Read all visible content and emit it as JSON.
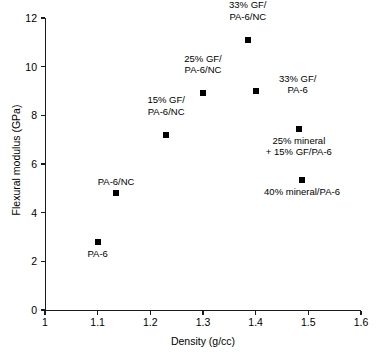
{
  "chart_data": {
    "type": "scatter",
    "title": "",
    "xlabel": "Density (g/cc)",
    "ylabel": "Flexural modulus (GPa)",
    "xlim": [
      1,
      1.6
    ],
    "ylim": [
      0,
      12
    ],
    "xticks": [
      "1",
      "1.1",
      "1.2",
      "1.3",
      "1.4",
      "1.5",
      "1.6"
    ],
    "xtick_values": [
      1,
      1.1,
      1.2,
      1.3,
      1.4,
      1.5,
      1.6
    ],
    "yticks": [
      "0",
      "2",
      "4",
      "6",
      "8",
      "10",
      "12"
    ],
    "ytick_values": [
      0,
      2,
      4,
      6,
      8,
      10,
      12
    ],
    "grid": false,
    "legend": "none",
    "marker_color": "#000000",
    "marker_shape": "square",
    "points": [
      {
        "label": "PA-6",
        "label_lines": [
          "PA-6"
        ],
        "x": 1.1,
        "y": 2.8,
        "label_dx": 0,
        "label_dy": 6
      },
      {
        "label": "PA-6/NC",
        "label_lines": [
          "PA-6/NC"
        ],
        "x": 1.135,
        "y": 4.8,
        "label_dx": 0,
        "label_dy": -17
      },
      {
        "label": "15% GF/PA-6/NC",
        "label_lines": [
          "15% GF/",
          "PA-6/NC"
        ],
        "x": 1.23,
        "y": 7.2,
        "label_dx": 0,
        "label_dy": -29
      },
      {
        "label": "25% GF/PA-6/NC",
        "label_lines": [
          "25% GF/",
          "PA-6/NC"
        ],
        "x": 1.3,
        "y": 8.9,
        "label_dx": 0,
        "label_dy": -29
      },
      {
        "label": "33% GF/PA-6/NC",
        "label_lines": [
          "33% GF/",
          "PA-6/NC"
        ],
        "x": 1.385,
        "y": 11.1,
        "label_dx": 0,
        "label_dy": -29
      },
      {
        "label": "33% GF/PA-6",
        "label_lines": [
          "33% GF/",
          "PA-6"
        ],
        "x": 1.4,
        "y": 9.0,
        "label_dx": 42,
        "label_dy": -7
      },
      {
        "label": "25% mineral + 15% GF/PA-6",
        "label_lines": [
          "25% mineral",
          "+ 15% GF/PA-6"
        ],
        "x": 1.482,
        "y": 7.45,
        "label_dx": 0,
        "label_dy": 6
      },
      {
        "label": "40% mineral/PA-6",
        "label_lines": [
          "40% mineral/PA-6"
        ],
        "x": 1.488,
        "y": 5.35,
        "label_dx": 0,
        "label_dy": 6
      }
    ]
  }
}
